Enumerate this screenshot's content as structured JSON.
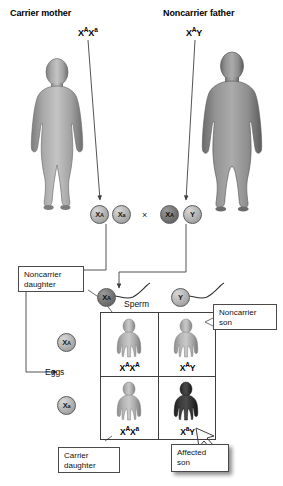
{
  "figure": {
    "title_top_left": "Carrier mother",
    "title_top_right": "Noncarrier father",
    "parents": [
      {
        "role": "mother",
        "label": "Carrier mother",
        "genotype_x": "X",
        "genotype_sup1": "A",
        "genotype_x2": "X",
        "genotype_sup2": "a",
        "sex": "female",
        "shade": "light-gray"
      },
      {
        "role": "father",
        "label": "Noncarrier father",
        "genotype_x": "X",
        "genotype_sup1": "A",
        "genotype_y": "Y",
        "sex": "male",
        "shade": "medium-gray"
      }
    ],
    "cross_symbol": "×",
    "gametes_mother": [
      {
        "base": "X",
        "sup": "A",
        "shade": "light"
      },
      {
        "base": "X",
        "sup": "a",
        "shade": "light"
      }
    ],
    "gametes_father": [
      {
        "base": "X",
        "sup": "A",
        "shade": "dark"
      },
      {
        "base": "Y",
        "sup": "",
        "shade": "light"
      }
    ],
    "sperm": [
      {
        "base": "X",
        "sup": "A",
        "shade": "dark"
      },
      {
        "base": "Y",
        "sup": "",
        "shade": "light"
      }
    ],
    "sperm_label": "Sperm",
    "eggs_label": "Eggs",
    "eggs": [
      {
        "base": "X",
        "sup": "A",
        "shade": "light"
      },
      {
        "base": "X",
        "sup": "a",
        "shade": "light"
      }
    ],
    "punnett": {
      "cells": [
        {
          "position": "top-left",
          "base1": "X",
          "sup1": "A",
          "base2": "X",
          "sup2": "A",
          "phenotype": "noncarrier daughter",
          "child_sex": "female",
          "child_shade": "light"
        },
        {
          "position": "top-right",
          "base1": "X",
          "sup1": "A",
          "base2": "Y",
          "sup2": "",
          "phenotype": "noncarrier son",
          "child_sex": "male",
          "child_shade": "light"
        },
        {
          "position": "bottom-left",
          "base1": "X",
          "sup1": "A",
          "base2": "X",
          "sup2": "a",
          "phenotype": "carrier daughter",
          "child_sex": "female",
          "child_shade": "light"
        },
        {
          "position": "bottom-right",
          "base1": "X",
          "sup1": "a",
          "base2": "Y",
          "sup2": "",
          "phenotype": "affected son",
          "child_sex": "male",
          "child_shade": "dark"
        }
      ]
    },
    "callouts": [
      {
        "id": "noncarrier-daughter",
        "line1": "Noncarrier",
        "line2": "daughter"
      },
      {
        "id": "noncarrier-son",
        "line1": "Noncarrier",
        "line2": "son"
      },
      {
        "id": "carrier-daughter",
        "line1": "Carrier",
        "line2": "daughter"
      },
      {
        "id": "affected-son",
        "line1": "Affected",
        "line2": "son"
      }
    ],
    "colors": {
      "line": "#3f3f3f",
      "text": "#000000",
      "figure_light": "#b0b0b0",
      "figure_dark": "#3a3a3a",
      "background": "#ffffff"
    }
  }
}
